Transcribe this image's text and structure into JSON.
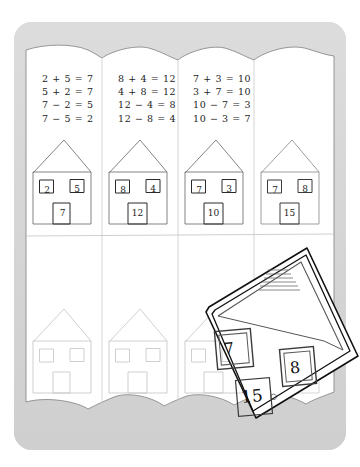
{
  "app": {
    "title": "Number bond houses worksheet",
    "card_color": "#d7d7d7",
    "paper_color": "#ffffff",
    "ink_color": "#232323"
  },
  "worksheet": {
    "rows": [
      {
        "row_label": "completed-row",
        "cells": [
          {
            "cell_label": "cell-1",
            "equations": [
              "2 + 5 = 7",
              "5 + 2 = 7",
              "7 − 2 = 5",
              "7 − 5 = 2"
            ],
            "house": {
              "window_left": "2",
              "window_right": "5",
              "door": "7",
              "filled": true
            }
          },
          {
            "cell_label": "cell-2",
            "equations": [
              "8 + 4 = 12",
              "4 + 8 = 12",
              "12 − 4 = 8",
              "12 − 8 = 4"
            ],
            "house": {
              "window_left": "8",
              "window_right": "4",
              "door": "12",
              "filled": true
            }
          },
          {
            "cell_label": "cell-3",
            "equations": [
              "7 + 3 = 10",
              "3 + 7 = 10",
              "10 − 7 = 3",
              "10 − 3 = 7"
            ],
            "house": {
              "window_left": "7",
              "window_right": "3",
              "door": "10",
              "filled": true
            }
          },
          {
            "cell_label": "cell-4",
            "equations": [],
            "house": {
              "window_left": "7",
              "window_right": "8",
              "door": "15",
              "filled": true
            }
          }
        ]
      },
      {
        "row_label": "blank-row",
        "cells": [
          {
            "cell_label": "cell-5",
            "equations": [],
            "house": {
              "window_left": "",
              "window_right": "",
              "door": "",
              "filled": false
            }
          },
          {
            "cell_label": "cell-6",
            "equations": [],
            "house": {
              "window_left": "",
              "window_right": "",
              "door": "",
              "filled": false
            }
          },
          {
            "cell_label": "cell-7",
            "equations": [],
            "house": {
              "window_left": "",
              "window_right": "",
              "door": "",
              "filled": false
            }
          },
          {
            "cell_label": "cell-8",
            "equations": [],
            "house": {
              "window_left": "",
              "window_right": "",
              "door": "",
              "filled": false
            }
          }
        ]
      }
    ]
  },
  "overlay_house": {
    "label": "magnified-house-cutout",
    "window_left": "7",
    "window_right": "8",
    "door": "15",
    "cursor_mark": "○"
  }
}
